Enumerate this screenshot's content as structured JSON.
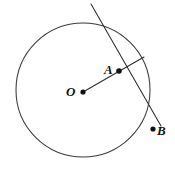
{
  "figure": {
    "background_color": "#ffffff",
    "stroke_color": "#2b2b2b",
    "circle_stroke_color": "#3a3a3a",
    "dot_color": "#111111",
    "label_color": "#111111",
    "width": 175,
    "height": 170
  },
  "circle": {
    "name": "main-circle",
    "center_x": 83,
    "center_y": 90,
    "radius": 67
  },
  "points": [
    {
      "id": "O",
      "label": "O",
      "dot_x": 83,
      "dot_y": 92,
      "dot_r": 2.6,
      "label_x": 66,
      "label_y": 96,
      "label_size": 13,
      "role": "center"
    },
    {
      "id": "A",
      "label": "A",
      "dot_x": 119,
      "dot_y": 71,
      "dot_r": 2.8,
      "label_x": 104,
      "label_y": 74,
      "label_size": 13,
      "role": "intersection"
    },
    {
      "id": "B",
      "label": "B",
      "dot_x": 153,
      "dot_y": 129,
      "dot_r": 2.6,
      "label_x": 157,
      "label_y": 135,
      "label_size": 13,
      "role": "external"
    }
  ],
  "lines": [
    {
      "id": "secant-line",
      "label": "secant through A and B",
      "x1": 91,
      "y1": 4,
      "x2": 161,
      "y2": 126
    },
    {
      "id": "radius-line",
      "label": "segment from O through A to circle",
      "x1": 83,
      "y1": 92,
      "x2": 144,
      "y2": 57
    }
  ]
}
